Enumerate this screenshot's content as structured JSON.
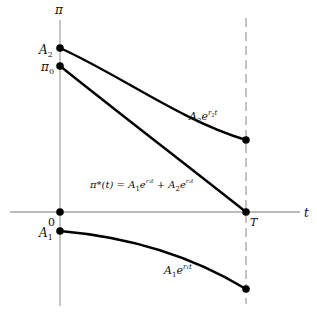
{
  "diagram": {
    "axes": {
      "y_label": "π",
      "x_label": "t",
      "origin_label": "0",
      "terminal_label": "T"
    },
    "points": {
      "A2": {
        "label_main": "A",
        "label_sub": "2"
      },
      "pi0": {
        "label_main": "π",
        "label_sub": "0"
      },
      "A1": {
        "label_main": "A",
        "label_sub": "1"
      }
    },
    "curves": {
      "upper": {
        "label_coef": "A",
        "label_coef_sub": "2",
        "label_exp": "e",
        "label_sup": "r",
        "label_sup_sub": "2",
        "label_sup_var": "t"
      },
      "middle": {
        "label_lhs": "π*(t) = ",
        "term1_coef": "A",
        "term1_sub": "1",
        "term1_exp": "e",
        "term1_sup": "r₁t",
        "plus": " + ",
        "term2_coef": "A",
        "term2_sub": "2",
        "term2_exp": "e",
        "term2_sup": "r₂t"
      },
      "lower": {
        "label_coef": "A",
        "label_coef_sub": "1",
        "label_exp": "e",
        "label_sup": "r₁t"
      }
    },
    "colors": {
      "axis": "#a6a6a6",
      "curve": "#000000",
      "dashed": "#9a9a9a"
    }
  }
}
